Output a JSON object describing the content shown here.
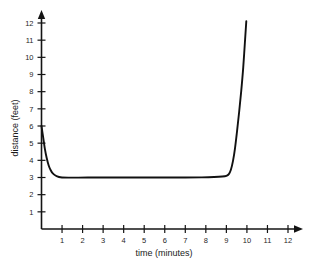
{
  "chart_data": {
    "type": "line",
    "title": "",
    "xlabel": "time (minutes)",
    "ylabel": "distance (feet)",
    "xlim": [
      0,
      12
    ],
    "ylim": [
      0,
      12
    ],
    "grid": false,
    "legend": "none",
    "x_ticks": [
      1,
      2,
      3,
      4,
      5,
      6,
      7,
      8,
      9,
      10,
      11,
      12
    ],
    "y_ticks": [
      1,
      2,
      3,
      4,
      5,
      6,
      7,
      8,
      9,
      10,
      11,
      12
    ],
    "x_tick_labels": [
      "1",
      "2",
      "3",
      "4",
      "5",
      "6",
      "7",
      "8",
      "9",
      "10",
      "11",
      "12"
    ],
    "y_tick_labels": [
      "1",
      "2",
      "3",
      "4",
      "5",
      "6",
      "7",
      "8",
      "9",
      "10",
      "11",
      "12"
    ],
    "series": [
      {
        "name": "distance",
        "x": [
          0.0,
          0.08,
          0.16,
          0.25,
          0.35,
          0.45,
          0.55,
          0.7,
          0.85,
          1.0,
          1.3,
          1.8,
          2.5,
          3.2,
          4.0,
          5.0,
          6.0,
          7.0,
          7.8,
          8.4,
          8.8,
          9.0,
          9.12,
          9.22,
          9.32,
          9.42,
          9.52,
          9.62,
          9.72,
          9.82,
          9.92,
          9.97
        ],
        "y": [
          6.0,
          5.35,
          4.7,
          4.15,
          3.7,
          3.42,
          3.24,
          3.1,
          3.03,
          3.0,
          2.99,
          2.99,
          3.0,
          3.0,
          3.0,
          3.0,
          3.0,
          3.0,
          3.01,
          3.03,
          3.06,
          3.1,
          3.2,
          3.45,
          3.95,
          4.7,
          5.7,
          6.8,
          8.0,
          9.4,
          11.2,
          12.1
        ],
        "color": "#111111"
      }
    ],
    "colors": {
      "axis": "#141414",
      "curve": "#111111",
      "background": "#ffffff",
      "text": "#1a1a1a"
    }
  }
}
